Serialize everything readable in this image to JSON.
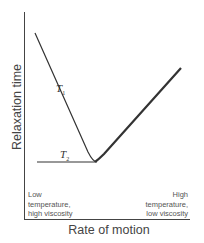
{
  "diagram": {
    "y_axis_label": "Relaxation time",
    "x_axis_label": "Rate of motion",
    "left_note": [
      "Low",
      "temperature,",
      "high viscosity"
    ],
    "right_note": [
      "High",
      "temperature,",
      "low viscosity"
    ],
    "curves": [
      {
        "name": "T",
        "subscript": "1",
        "description": "Curve decreasing steeply then rising after minimum"
      },
      {
        "name": "T",
        "subscript": "2",
        "description": "Flat line then rising after minimum"
      }
    ]
  }
}
